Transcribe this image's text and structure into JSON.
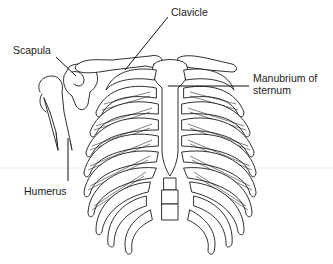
{
  "diagram": {
    "colors": {
      "line": "#1a1a1a",
      "background": "#ffffff",
      "guide": "#ececec"
    },
    "labels": [
      {
        "id": "clavicle",
        "text": "Clavicle"
      },
      {
        "id": "scapula",
        "text": "Scapula"
      },
      {
        "id": "manubrium",
        "text_line1": "Manubrium of",
        "text_line2": "sternum"
      },
      {
        "id": "humerus",
        "text": "Humerus"
      }
    ]
  }
}
